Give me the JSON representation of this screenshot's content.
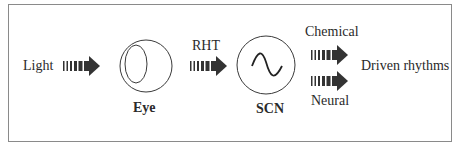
{
  "diagram": {
    "title": "",
    "nodes": [
      {
        "id": "light",
        "label": "Light"
      },
      {
        "id": "eye",
        "label": "Eye",
        "icon": "eye-icon"
      },
      {
        "id": "scn",
        "label": "SCN",
        "icon": "sine-wave-icon"
      },
      {
        "id": "driven",
        "label": "Driven rhythms"
      }
    ],
    "edges": [
      {
        "from": "light",
        "to": "eye",
        "label": ""
      },
      {
        "from": "eye",
        "to": "scn",
        "label": "RHT"
      },
      {
        "from": "scn",
        "to": "driven",
        "label": "Chemical"
      },
      {
        "from": "scn",
        "to": "driven",
        "label": "Neural"
      }
    ],
    "colors": {
      "arrow": "#333333",
      "stroke": "#3a3a3a",
      "border": "#8a8a8a",
      "text": "#2a2a2a"
    }
  }
}
